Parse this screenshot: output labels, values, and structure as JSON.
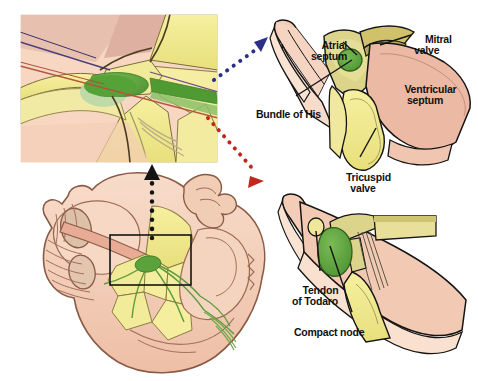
{
  "figure": {
    "background_color": "#ffffff",
    "width": 478,
    "height": 381
  },
  "palette": {
    "myocardium_pink": "#f0c3ab",
    "myocardium_pink_light": "#f7d9c6",
    "myocardium_rose": "#e0a794",
    "valve_yellow": "#f2ec88",
    "valve_yellow_olive": "#ded77a",
    "node_green": "#57a03a",
    "node_green_light": "#b6d79a",
    "tendon_yellow": "#efe79a",
    "outline_black": "#1a1a1a",
    "outline_brown": "#6b4a3a",
    "arrow_blue": "#2b2f86",
    "arrow_red": "#c0281e",
    "arrow_black": "#141414"
  },
  "panels": {
    "inset": {
      "name": "magnified-conduction-inset",
      "bounds": {
        "x": 20,
        "y": 14,
        "width": 198,
        "height": 149
      }
    },
    "heart_section": {
      "name": "heart-cross-section",
      "bounds": {
        "x": 8,
        "y": 172,
        "width": 262,
        "height": 205
      },
      "focus_rect": {
        "x": 110,
        "y": 235,
        "width": 81,
        "height": 50
      }
    },
    "upper_right": {
      "name": "superior-septal-view",
      "bounds": {
        "x": 264,
        "y": 8,
        "width": 210,
        "height": 175
      }
    },
    "lower_right": {
      "name": "inferior-septal-view",
      "bounds": {
        "x": 264,
        "y": 190,
        "width": 210,
        "height": 185
      }
    }
  },
  "labels": {
    "atrial_septum": {
      "text": "Atrial\nseptum",
      "x": 305,
      "y": 30
    },
    "mitral_valve": {
      "text": "Mitral\nvalve",
      "x": 414,
      "y": 24
    },
    "ventricular_septum": {
      "text": "Ventricular\nseptum",
      "x": 391,
      "y": 75
    },
    "bundle_of_his": {
      "text": "Bundle of His",
      "x": 247,
      "y": 101
    },
    "tricuspid_valve": {
      "text": "Tricuspid\nvalve",
      "x": 336,
      "y": 163
    },
    "tendon_of_todaro": {
      "text": "Tendon\nof Todaro",
      "x": 288,
      "y": 276
    },
    "compact_node": {
      "text": "Compact node",
      "x": 284,
      "y": 318
    }
  },
  "connectors": {
    "arrow_to_upper_right": {
      "name": "dotted-arrow-blue",
      "color": "#2b2f86",
      "from": {
        "x": 216,
        "y": 73
      },
      "to": {
        "x": 268,
        "y": 38
      },
      "style": "dotted",
      "head": "triangle"
    },
    "arrow_to_lower_right": {
      "name": "dotted-arrow-red",
      "color": "#c0281e",
      "from": {
        "x": 216,
        "y": 122
      },
      "to": {
        "x": 268,
        "y": 183
      },
      "style": "dotted",
      "head": "triangle"
    },
    "arrow_to_inset": {
      "name": "dotted-arrow-black",
      "color": "#141414",
      "from": {
        "x": 152,
        "y": 240
      },
      "to": {
        "x": 152,
        "y": 166
      },
      "style": "dotted",
      "head": "triangle"
    }
  },
  "leader_lines": {
    "atrial_septum": {
      "from": {
        "x": 343,
        "y": 42
      },
      "to": {
        "x": 357,
        "y": 55
      }
    },
    "mitral_valve": {
      "from": {
        "x": 410,
        "y": 34
      },
      "to": {
        "x": 381,
        "y": 44
      }
    },
    "bundle_of_his": {
      "from": {
        "x": 295,
        "y": 96
      },
      "to": {
        "x": 352,
        "y": 60
      }
    },
    "tricuspid_valve": {
      "from": {
        "x": 360,
        "y": 158
      },
      "to": {
        "x": 376,
        "y": 130
      }
    },
    "tendon_of_todaro": {
      "from": {
        "x": 320,
        "y": 272
      },
      "to": {
        "x": 316,
        "y": 228
      }
    },
    "compact_node": {
      "from": {
        "x": 352,
        "y": 313
      },
      "to": {
        "x": 330,
        "y": 245
      }
    }
  }
}
